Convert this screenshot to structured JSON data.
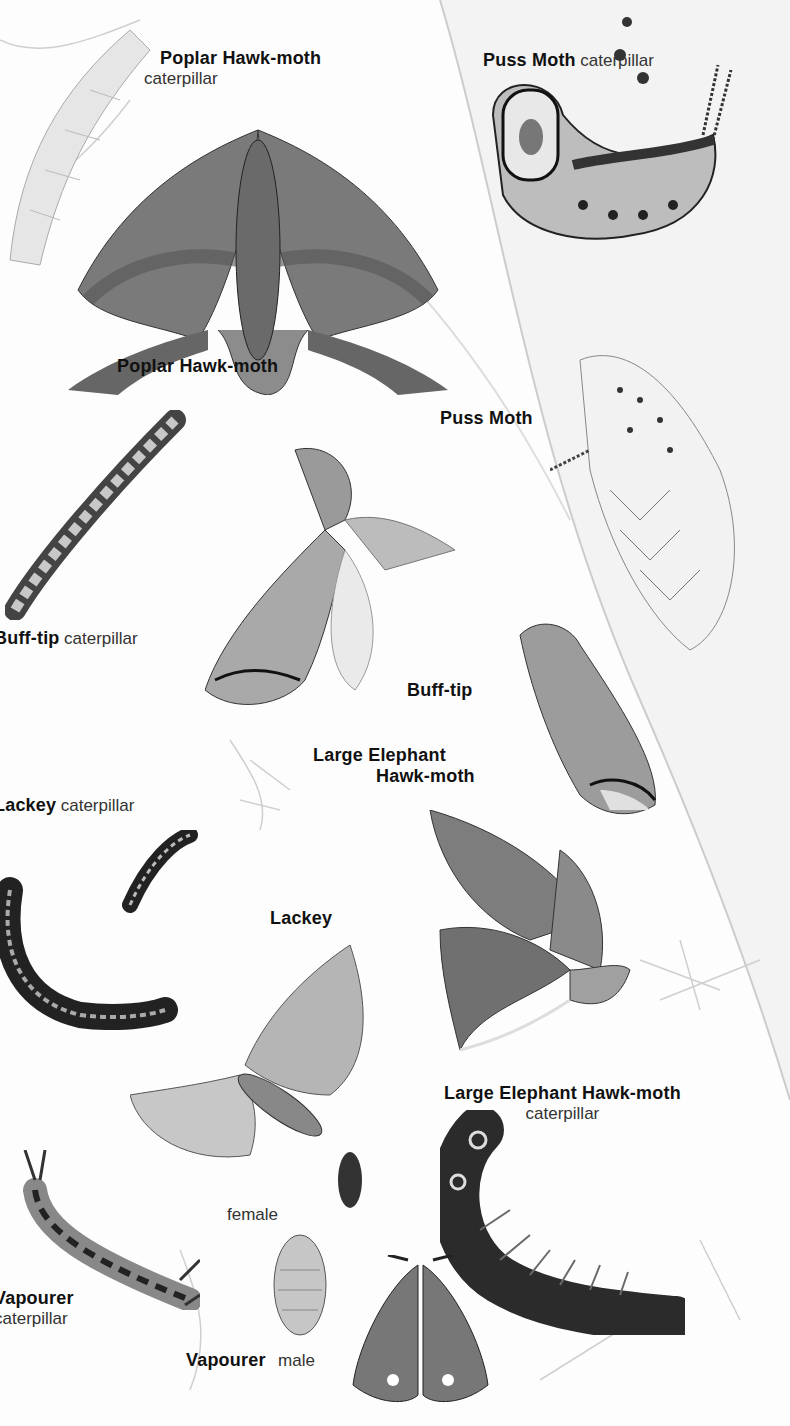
{
  "page": {
    "type": "illustrated field guide page",
    "color_mode": "grayscale"
  },
  "labels": [
    {
      "id": "poplar-hawk-moth-caterpillar",
      "name": "Poplar Hawk-moth",
      "sub": "caterpillar"
    },
    {
      "id": "puss-moth-caterpillar",
      "name": "Puss Moth",
      "sub": "caterpillar"
    },
    {
      "id": "poplar-hawk-moth",
      "name": "Poplar Hawk-moth",
      "sub": ""
    },
    {
      "id": "puss-moth",
      "name": "Puss Moth",
      "sub": ""
    },
    {
      "id": "buff-tip-caterpillar",
      "name": "Buff-tip",
      "sub": "caterpillar"
    },
    {
      "id": "buff-tip",
      "name": "Buff-tip",
      "sub": ""
    },
    {
      "id": "large-elephant-hawk-moth",
      "name_line1": "Large Elephant",
      "name_line2": "Hawk-moth"
    },
    {
      "id": "lackey-caterpillar",
      "name": "Lackey",
      "sub": "caterpillar"
    },
    {
      "id": "lackey",
      "name": "Lackey",
      "sub": ""
    },
    {
      "id": "large-elephant-hawk-moth-caterpillar",
      "name": "Large Elephant Hawk-moth",
      "sub": "caterpillar"
    },
    {
      "id": "vapourer-female",
      "name": "",
      "sub": "female"
    },
    {
      "id": "vapourer-caterpillar",
      "name": "Vapourer",
      "sub": "caterpillar"
    },
    {
      "id": "vapourer-male",
      "name": "Vapourer",
      "sub": "male"
    }
  ],
  "illustrations": [
    "poplar-hawk-moth-caterpillar",
    "poplar-hawk-moth",
    "puss-moth-caterpillar",
    "puss-moth",
    "buff-tip-caterpillar",
    "buff-tip-moth-spread",
    "buff-tip-moth-resting",
    "large-elephant-hawk-moth",
    "lackey-caterpillars",
    "lackey-moth",
    "large-elephant-hawk-moth-caterpillar",
    "vapourer-caterpillar",
    "vapourer-female",
    "vapourer-male",
    "leaf-sprigs"
  ]
}
